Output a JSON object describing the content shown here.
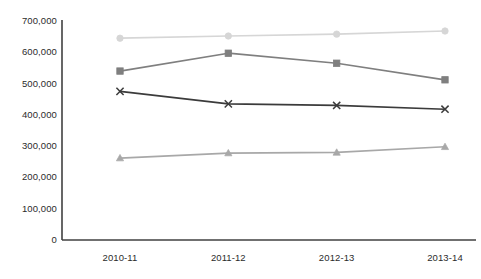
{
  "chart_data": {
    "type": "line",
    "title": "",
    "subtitle": "",
    "xlabel": "",
    "ylabel": "",
    "categories": [
      "2010-11",
      "2011-12",
      "2012-13",
      "2013-14"
    ],
    "ylim": [
      0,
      700000
    ],
    "ytick_labels": [
      "700,000",
      "600,000",
      "500,000",
      "400,000",
      "300,000",
      "200,000",
      "100,000",
      "0"
    ],
    "ytick_values": [
      700000,
      600000,
      500000,
      400000,
      300000,
      200000,
      100000,
      0
    ],
    "grid": false,
    "legend": "none",
    "series": [
      {
        "name": "series-1-circle",
        "marker": "circle",
        "color": "#d6d6d6",
        "values": [
          645000,
          652000,
          658000,
          668000
        ]
      },
      {
        "name": "series-2-square",
        "marker": "square",
        "color": "#7f7f7f",
        "values": [
          540000,
          597000,
          565000,
          512000
        ]
      },
      {
        "name": "series-3-cross",
        "marker": "x",
        "color": "#3b3b3b",
        "values": [
          475000,
          435000,
          430000,
          418000
        ]
      },
      {
        "name": "series-4-triangle",
        "marker": "triangle",
        "color": "#a8a8a8",
        "values": [
          262000,
          278000,
          280000,
          298000
        ]
      }
    ]
  },
  "axes": {
    "axis_color": "#404040",
    "plot_left": 62,
    "plot_right": 476,
    "plot_top": 20,
    "plot_bottom": 240
  }
}
